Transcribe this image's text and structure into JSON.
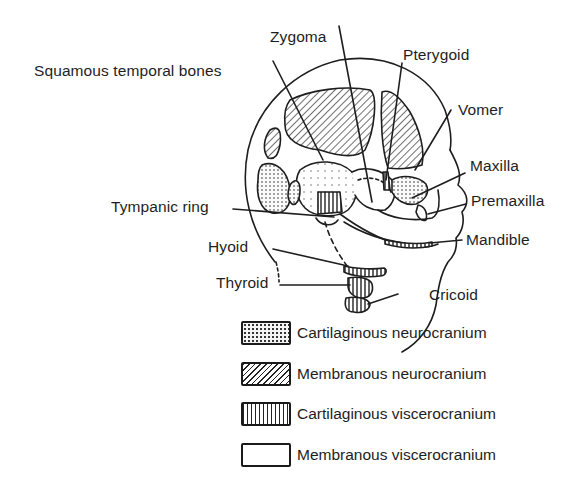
{
  "figure": {
    "labels": {
      "zygoma": "Zygoma",
      "squamous_temporal": "Squamous temporal bones",
      "pterygoid": "Pterygoid",
      "vomer": "Vomer",
      "maxilla": "Maxilla",
      "premaxilla": "Premaxilla",
      "tympanic_ring": "Tympanic ring",
      "mandible": "Mandible",
      "hyoid": "Hyoid",
      "thyroid": "Thyroid",
      "cricoid": "Cricoid"
    },
    "legend": [
      {
        "pattern": "stippled",
        "label": "Cartilaginous neurocranium"
      },
      {
        "pattern": "diagonal-hatch",
        "label": "Membranous neurocranium"
      },
      {
        "pattern": "vertical-lines",
        "label": "Cartilaginous viscerocranium"
      },
      {
        "pattern": "plain",
        "label": "Membranous viscerocranium"
      }
    ],
    "colors": {
      "ink": "#1e1e1e",
      "background": "#ffffff"
    }
  }
}
